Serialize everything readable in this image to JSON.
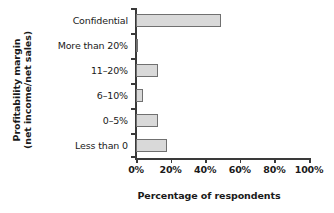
{
  "chart_data": {
    "type": "bar",
    "orientation": "horizontal",
    "title": "",
    "xlabel": "Percentage of respondents",
    "ylabel_line1": "Profitability margin",
    "ylabel_line2": "(net income/net sales)",
    "categories": [
      "Confidential",
      "More than 20%",
      "11–20%",
      "6–10%",
      "0–5%",
      "Less than 0"
    ],
    "values": [
      49,
      1,
      13,
      4,
      13,
      18
    ],
    "xlim": [
      0,
      100
    ],
    "xticks": [
      0,
      20,
      40,
      60,
      80,
      100
    ],
    "xtick_labels": [
      "0%",
      "20%",
      "40%",
      "60%",
      "80%",
      "100%"
    ],
    "grid": false,
    "legend": false,
    "bar_fill_color": "#d9d9d9",
    "bar_border_color": "#707070",
    "axis_color": "#3a3a3a",
    "text_color": "#1a1a1a"
  }
}
